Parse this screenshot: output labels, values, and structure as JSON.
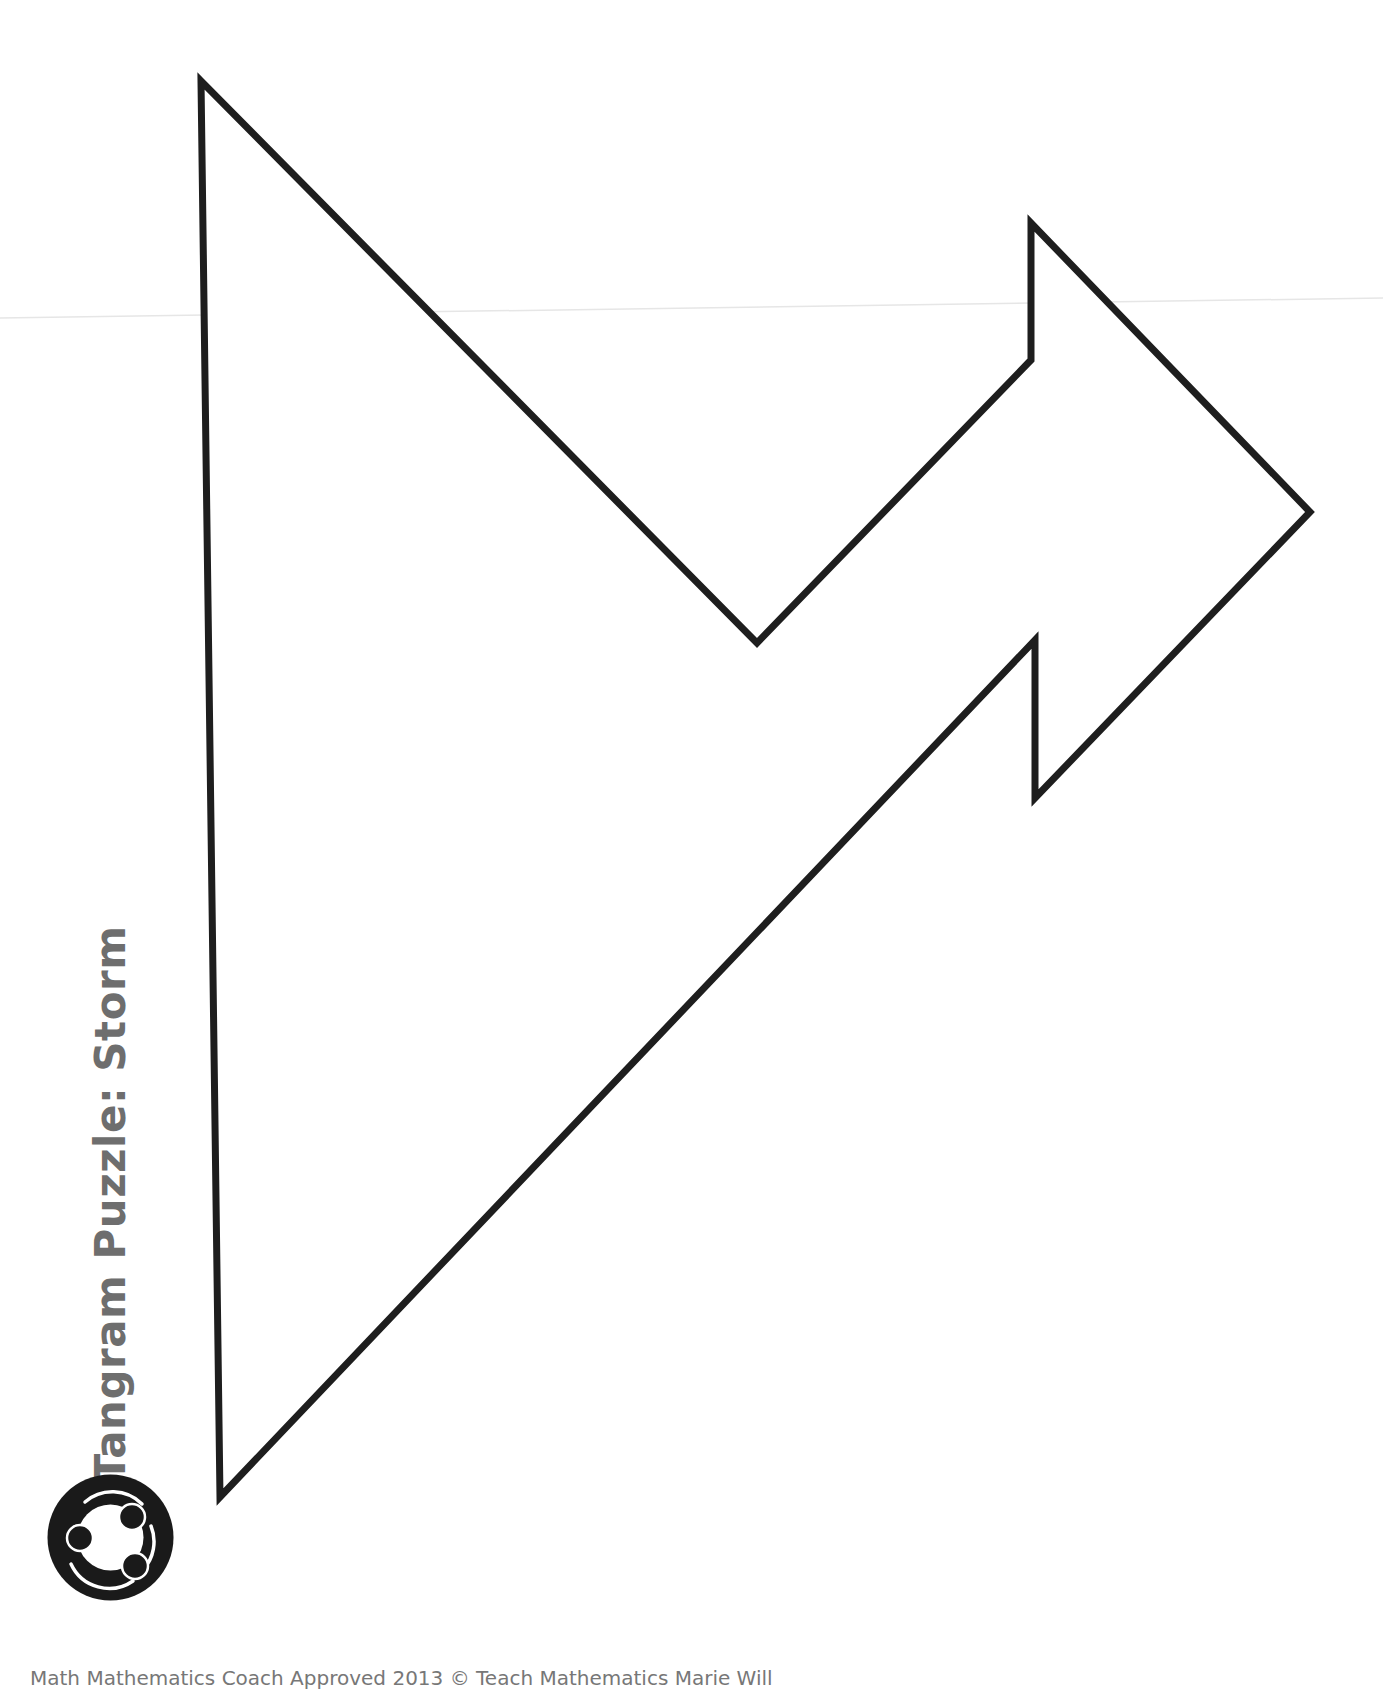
{
  "title": {
    "prefix": "Tangram ",
    "main": "Puzzle: Storm"
  },
  "logo": {
    "icon": "three-people-circle-logo-icon",
    "color": "#1a1a1a"
  },
  "puzzle": {
    "name": "Storm",
    "stroke_color": "#1e1e1e",
    "fill_color": "#ffffff",
    "stroke_width": 7,
    "outline_points": "201,81 757,643 1031,360 1031,223 1310,512 1035,798 1035,640 220,1497"
  },
  "footer": {
    "text": "Math Mathematics Coach Approved 2013 © Teach Mathematics Marie Will"
  },
  "colors": {
    "title": "#6e6e6e",
    "outline": "#1e1e1e",
    "background": "#ffffff"
  }
}
